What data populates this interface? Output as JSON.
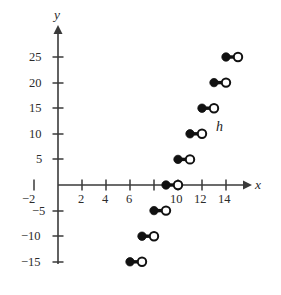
{
  "chart_data": {
    "type": "scatter",
    "title": "",
    "subtitle": "",
    "xlabel": "x",
    "ylabel": "y",
    "xlim": [
      -3,
      16
    ],
    "ylim": [
      -17,
      27
    ],
    "grid": false,
    "legend": null,
    "annotations": [
      {
        "text": "h",
        "x": 13.6,
        "y": 11.5,
        "style": "italic",
        "name": "function-label-h"
      }
    ],
    "x_ticks": [
      {
        "value": -2,
        "label": "−2"
      },
      {
        "value": 2,
        "label": "2"
      },
      {
        "value": 4,
        "label": "4"
      },
      {
        "value": 6,
        "label": "6"
      },
      {
        "value": 8,
        "label": ""
      },
      {
        "value": 10,
        "label": "10"
      },
      {
        "value": 12,
        "label": "12"
      },
      {
        "value": 14,
        "label": "14"
      }
    ],
    "y_ticks": [
      {
        "value": 25,
        "label": "25"
      },
      {
        "value": 20,
        "label": "20"
      },
      {
        "value": 15,
        "label": "15"
      },
      {
        "value": 10,
        "label": "10"
      },
      {
        "value": 5,
        "label": "5"
      },
      {
        "value": -5,
        "label": "−5"
      },
      {
        "value": -10,
        "label": "−10"
      },
      {
        "value": -15,
        "label": "−15"
      }
    ],
    "series": [
      {
        "name": "h",
        "style": "step-segments",
        "segments": [
          {
            "y": -15,
            "x_start": 6,
            "x_end": 7,
            "left_endpoint": "closed",
            "right_endpoint": "open"
          },
          {
            "y": -10,
            "x_start": 7,
            "x_end": 8,
            "left_endpoint": "closed",
            "right_endpoint": "open"
          },
          {
            "y": -5,
            "x_start": 8,
            "x_end": 9,
            "left_endpoint": "closed",
            "right_endpoint": "open"
          },
          {
            "y": 0,
            "x_start": 9,
            "x_end": 10,
            "left_endpoint": "closed",
            "right_endpoint": "open"
          },
          {
            "y": 5,
            "x_start": 10,
            "x_end": 11,
            "left_endpoint": "closed",
            "right_endpoint": "open"
          },
          {
            "y": 10,
            "x_start": 11,
            "x_end": 12,
            "left_endpoint": "closed",
            "right_endpoint": "open"
          },
          {
            "y": 15,
            "x_start": 12,
            "x_end": 13,
            "left_endpoint": "closed",
            "right_endpoint": "open"
          },
          {
            "y": 20,
            "x_start": 13,
            "x_end": 14,
            "left_endpoint": "closed",
            "right_endpoint": "open"
          },
          {
            "y": 25,
            "x_start": 14,
            "x_end": 15,
            "left_endpoint": "closed",
            "right_endpoint": "open"
          }
        ]
      }
    ],
    "colors": {
      "axis": "#3a3a3a",
      "marker": "#111111",
      "marker_open_fill": "#ffffff",
      "background": "#ffffff"
    }
  },
  "labels": {
    "x_axis_name": "x",
    "y_axis_name": "y",
    "curve_label": "h",
    "x_tick_neg2": "−2",
    "x_tick_2": "2",
    "x_tick_4": "4",
    "x_tick_6": "6",
    "x_tick_10": "10",
    "x_tick_12": "12",
    "x_tick_14": "14",
    "y_tick_25": "25",
    "y_tick_20": "20",
    "y_tick_15": "15",
    "y_tick_10": "10",
    "y_tick_5": "5",
    "y_tick_neg5": "−5",
    "y_tick_neg10": "−10",
    "y_tick_neg15": "−15"
  }
}
